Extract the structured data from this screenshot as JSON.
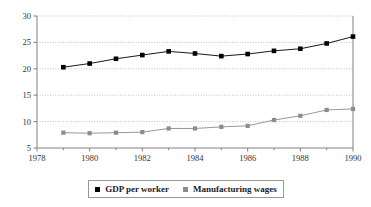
{
  "chart_data": {
    "type": "line",
    "title": "",
    "subtitle": "",
    "xlabel": "",
    "ylabel": "",
    "xlim": [
      1978,
      1990
    ],
    "ylim": [
      5,
      30
    ],
    "ytick_values": [
      5,
      10,
      15,
      20,
      25,
      30
    ],
    "ytick_labels": [
      "5",
      "10",
      "15",
      "20",
      "25",
      "30"
    ],
    "xtick_values": [
      1978,
      1980,
      1982,
      1984,
      1986,
      1988,
      1990
    ],
    "xtick_labels": [
      "1978",
      "1980",
      "1982",
      "1984",
      "1986",
      "1988",
      "1990"
    ],
    "xminor_values": [
      1979,
      1981,
      1983,
      1985,
      1987,
      1989
    ],
    "grid": "horizontal-dotted",
    "legend_position": "bottom-center",
    "x": [
      1979,
      1980,
      1981,
      1982,
      1983,
      1984,
      1985,
      1986,
      1987,
      1988,
      1989,
      1990
    ],
    "series": [
      {
        "name": "GDP per worker",
        "color": "#000000",
        "marker": "square",
        "values": [
          20.3,
          21.0,
          21.9,
          22.6,
          23.3,
          22.9,
          22.4,
          22.8,
          23.4,
          23.8,
          24.8,
          26.1
        ]
      },
      {
        "name": "Manufacturing wages",
        "color": "#8c8c8c",
        "marker": "square",
        "values": [
          7.9,
          7.8,
          7.9,
          8.0,
          8.7,
          8.7,
          9.0,
          9.2,
          10.3,
          11.1,
          12.2,
          12.4
        ]
      }
    ]
  },
  "legend": {
    "items": [
      {
        "label": "GDP per worker",
        "color": "#000000"
      },
      {
        "label": "Manufacturing wages",
        "color": "#8c8c8c"
      }
    ]
  },
  "colors": {
    "series_1": "#000000",
    "series_2": "#8c8c8c",
    "axis": "#808080",
    "grid": "#b0b0b0",
    "text": "#333333"
  }
}
